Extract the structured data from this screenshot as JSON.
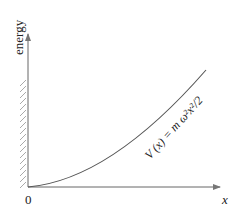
{
  "diagram": {
    "y_axis_label": "energy",
    "x_axis_label": "x",
    "origin_label": "0",
    "curve_label": "V (x) = m ω²x²/2",
    "curve_type": "parabola (harmonic potential, x ≥ 0)",
    "wall": "hatched wall at x = 0 (left side)",
    "colors": {
      "line": "#555555",
      "hatch": "#aaaaaa",
      "text": "#222222"
    }
  }
}
